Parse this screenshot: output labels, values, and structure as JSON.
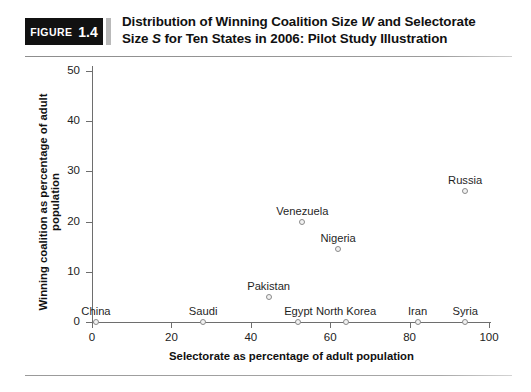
{
  "figure": {
    "badge_word": "FIGURE",
    "badge_number": "1.4",
    "title_line1_a": "Distribution of Winning Coalition Size ",
    "title_line1_w": "W",
    "title_line1_b": " and Selectorate",
    "title_line2_a": "Size ",
    "title_line2_s": "S",
    "title_line2_b": " for Ten States in 2006: Pilot Study Illustration"
  },
  "chart_data": {
    "type": "scatter",
    "title": "Distribution of Winning Coalition Size W and Selectorate Size S for Ten States in 2006: Pilot Study Illustration",
    "xlabel": "Selectorate as percentage of adult population",
    "ylabel": "Winning coalition as percentage of adult population",
    "xlim": [
      0,
      100
    ],
    "ylim": [
      0,
      50
    ],
    "xticks": [
      "0",
      "20",
      "40",
      "60",
      "80",
      "100"
    ],
    "yticks": [
      "0",
      "10",
      "20",
      "30",
      "40",
      "50"
    ],
    "grid": false,
    "legend": "none",
    "points": [
      {
        "label": "China",
        "x": 1,
        "y": 0
      },
      {
        "label": "Saudi",
        "x": 28,
        "y": 0
      },
      {
        "label": "Pakistan",
        "x": 44.5,
        "y": 5
      },
      {
        "label": "Egypt",
        "x": 52,
        "y": 0
      },
      {
        "label": "Venezuela",
        "x": 53,
        "y": 20
      },
      {
        "label": "Nigeria",
        "x": 62,
        "y": 14.5
      },
      {
        "label": "North Korea",
        "x": 64,
        "y": 0
      },
      {
        "label": "Iran",
        "x": 82,
        "y": 0
      },
      {
        "label": "Syria",
        "x": 94,
        "y": 0
      },
      {
        "label": "Russia",
        "x": 94,
        "y": 26
      }
    ]
  },
  "colors": {
    "badge_background": "#111111",
    "marker_stroke": "#8a8a8a",
    "marker_fill": "#f2f2f2",
    "axis": "#6e6e6e",
    "text": "#1a1a1a"
  }
}
